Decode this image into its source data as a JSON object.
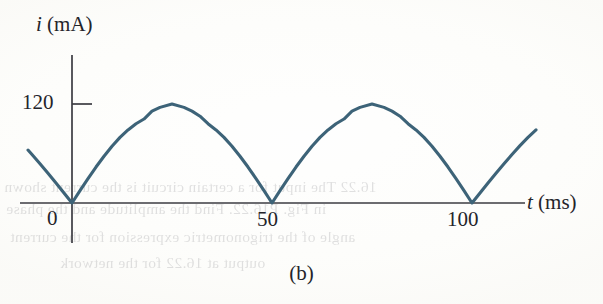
{
  "figure": {
    "caption": "(b)",
    "background_color": "#fdfdfb",
    "curve_color": "#3d6378",
    "axis_color": "#3b3b42"
  },
  "axes": {
    "y": {
      "symbol": "i",
      "unit": "(mA)",
      "label": "i (mA)",
      "tick_labels": [
        "120"
      ]
    },
    "x": {
      "symbol": "t",
      "unit": "(ms)",
      "label": "t (ms)",
      "tick_labels": [
        "0",
        "50",
        "100"
      ]
    }
  },
  "ghost_text": {
    "lines": [
      "16.22 The input for a certain circuit is the current shown",
      "in Fig. P16.22. Find the amplitude and the phase",
      "angle of the trigonometric expression for the current",
      "output at 16.22 for the network"
    ]
  },
  "chart_data": {
    "type": "line",
    "title": "(b)",
    "xlabel": "t (ms)",
    "ylabel": "i (mA)",
    "xlim": [
      -11,
      118
    ],
    "ylim": [
      0,
      155
    ],
    "xticks": [
      0,
      50,
      100
    ],
    "yticks": [
      120
    ],
    "grid": false,
    "legend": null,
    "formula": "i(t) = 120 |sin(pi t / 50)| mA",
    "peak_value": 120,
    "peak_unit": "mA",
    "half_period_ms": 50,
    "zero_crossings_ms": [
      0,
      50,
      100
    ],
    "peaks_ms": [
      25,
      75
    ],
    "series": [
      {
        "name": "i(t)",
        "x": [
          -11,
          -10,
          -8,
          -6,
          -4,
          -2,
          0,
          2,
          4,
          6,
          8,
          10,
          12,
          14,
          16,
          18,
          20,
          22,
          25,
          28,
          30,
          32,
          34,
          36,
          38,
          40,
          42,
          44,
          46,
          48,
          50,
          52,
          54,
          56,
          58,
          60,
          62,
          64,
          66,
          68,
          70,
          72,
          75,
          78,
          80,
          82,
          84,
          86,
          88,
          90,
          92,
          94,
          96,
          98,
          100,
          102,
          104,
          106,
          108,
          110,
          112,
          114,
          116
        ],
        "y": [
          64.2,
          58.8,
          47.6,
          36.1,
          24.3,
          12.2,
          0,
          15.0,
          29.6,
          43.6,
          56.7,
          68.8,
          79.5,
          88.6,
          96.1,
          101.8,
          111.3,
          115.9,
          120.0,
          115.9,
          111.3,
          105.2,
          96.1,
          88.6,
          79.5,
          68.8,
          56.7,
          43.6,
          29.6,
          15.0,
          0,
          15.0,
          29.6,
          43.6,
          56.7,
          68.8,
          79.5,
          88.6,
          96.1,
          101.8,
          111.3,
          115.9,
          120.0,
          115.9,
          111.3,
          105.2,
          96.1,
          88.6,
          79.5,
          68.8,
          56.7,
          43.6,
          29.6,
          15.0,
          0,
          12.2,
          24.3,
          36.1,
          47.6,
          58.8,
          69.5,
          79.5,
          88.6
        ]
      }
    ]
  }
}
